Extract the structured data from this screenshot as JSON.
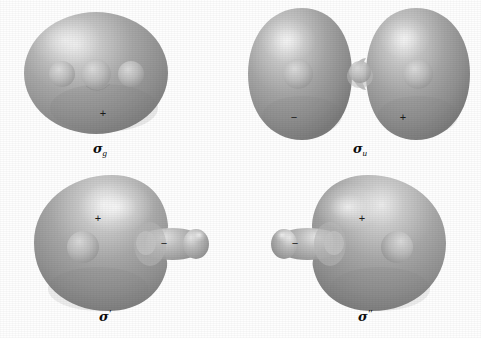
{
  "figure": {
    "kind": "molecular-orbital-isosurface-diagram",
    "background_color": "#fefefe",
    "surface_color_mid": "#9a9a9a",
    "surface_color_light": "#e8e8e8",
    "surface_color_dark": "#6e6e6e",
    "sign_text_color": "#1a1a1a",
    "label_text_color": "#0d0d0d"
  },
  "panels": [
    {
      "id": "sigma-g",
      "name": "sigma-g-orbital",
      "label": {
        "symbol": "σ",
        "sub": "g",
        "prime": "",
        "full": "σg"
      },
      "nuclei_count": 3,
      "lobes": [
        {
          "sign": "+",
          "name": "main-lobe"
        }
      ],
      "signs": [
        {
          "glyph": "+",
          "x": 103,
          "y": 114
        }
      ]
    },
    {
      "id": "sigma-u",
      "name": "sigma-u-orbital",
      "label": {
        "symbol": "σ",
        "sub": "u",
        "prime": "",
        "full": "σu"
      },
      "nuclei_count": 3,
      "lobes": [
        {
          "sign": "−",
          "name": "left-lobe"
        },
        {
          "sign": "+",
          "name": "right-lobe"
        }
      ],
      "signs": [
        {
          "glyph": "−",
          "x": 294,
          "y": 118
        },
        {
          "glyph": "+",
          "x": 403,
          "y": 118
        }
      ]
    },
    {
      "id": "sigma-prime",
      "name": "sigma-prime-orbital",
      "label": {
        "symbol": "σ",
        "sub": "",
        "prime": "′",
        "full": "σ′"
      },
      "nuclei_count": 3,
      "lobes": [
        {
          "sign": "+",
          "name": "main-lobe"
        },
        {
          "sign": "−",
          "name": "small-lobe"
        }
      ],
      "signs": [
        {
          "glyph": "+",
          "x": 98,
          "y": 219
        },
        {
          "glyph": "−",
          "x": 164,
          "y": 244
        }
      ]
    },
    {
      "id": "sigma-double-prime",
      "name": "sigma-double-prime-orbital",
      "label": {
        "symbol": "σ",
        "sub": "",
        "prime": "″",
        "full": "σ″"
      },
      "nuclei_count": 3,
      "lobes": [
        {
          "sign": "+",
          "name": "main-lobe"
        },
        {
          "sign": "−",
          "name": "small-lobe"
        }
      ],
      "signs": [
        {
          "glyph": "+",
          "x": 362,
          "y": 219
        },
        {
          "glyph": "−",
          "x": 295,
          "y": 244
        }
      ]
    }
  ]
}
